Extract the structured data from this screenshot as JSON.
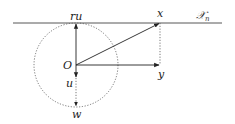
{
  "diagram": {
    "type": "geometric-vector-diagram",
    "labels": {
      "origin": "O",
      "top_point": "ru",
      "x_point": "x",
      "y_point": "y",
      "u_point": "u",
      "w_point": "w",
      "hyperplane_main": "𝒳",
      "hyperplane_sub": "n"
    },
    "elements": {
      "hyperplane_line": {
        "from": [
          13,
          23
        ],
        "to": [
          222,
          23
        ],
        "style": "solid"
      },
      "circle": {
        "center": [
          76,
          65
        ],
        "radius": 42,
        "style": "dotted"
      },
      "arrow_O_to_ru": {
        "from": [
          76,
          65
        ],
        "to": [
          76,
          23
        ]
      },
      "arrow_O_to_x": {
        "from": [
          76,
          65
        ],
        "to": [
          160,
          23
        ]
      },
      "arrow_O_to_y": {
        "from": [
          76,
          65
        ],
        "to": [
          160,
          65
        ]
      },
      "dotted_x_to_y": {
        "from": [
          160,
          23
        ],
        "to": [
          160,
          65
        ]
      },
      "arrow_O_to_u": {
        "from": [
          76,
          65
        ],
        "to": [
          76,
          77
        ]
      },
      "dotted_u_to_w": {
        "from": [
          76,
          77
        ],
        "to": [
          76,
          107
        ]
      }
    },
    "colors": {
      "stroke": "#333333",
      "dotted": "#555555",
      "background": "#ffffff"
    }
  }
}
